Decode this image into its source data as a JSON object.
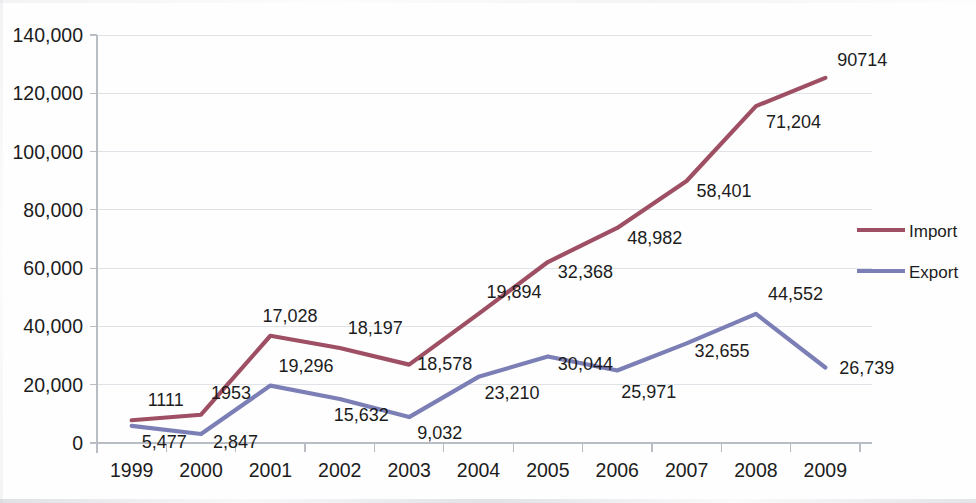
{
  "chart_data": {
    "type": "line",
    "title": "",
    "xlabel": "",
    "ylabel": "",
    "categories": [
      "1999",
      "2000",
      "2001",
      "2002",
      "2003",
      "2004",
      "2005",
      "2006",
      "2007",
      "2008",
      "2009"
    ],
    "ylim": [
      0,
      140000
    ],
    "ytick_values": [
      0,
      20000,
      40000,
      60000,
      80000,
      100000,
      120000,
      140000
    ],
    "ytick_labels": [
      "0",
      "20,000",
      "40,000",
      "60,000",
      "80,000",
      "100,000",
      "120,000",
      "140,000"
    ],
    "grid": true,
    "legend_position": "right",
    "series": [
      {
        "name": "Import",
        "color": "#9e4f63",
        "values": [
          7800,
          9700,
          36800,
          32600,
          26900,
          44300,
          62100,
          73800,
          89900,
          115600,
          125300
        ],
        "data_labels": [
          "1111",
          "1953",
          "17,028",
          "18,197",
          "18,578",
          "19,894",
          "32,368",
          "48,982",
          "58,401",
          "71,204",
          "90714"
        ]
      },
      {
        "name": "Export",
        "color": "#7b7fb5",
        "values": [
          5900,
          3100,
          19700,
          15100,
          8900,
          22700,
          29700,
          24900,
          34200,
          44300,
          25900
        ],
        "data_labels": [
          "5,477",
          "2,847",
          "19,296",
          "15,632",
          "9,032",
          "23,210",
          "30,044",
          "25,971",
          "32,655",
          "44,552",
          "26,739"
        ]
      }
    ]
  },
  "legend": {
    "entries": [
      {
        "label": "Import",
        "color": "#9e4f63"
      },
      {
        "label": "Export",
        "color": "#7b7fb5"
      }
    ]
  },
  "label_offsets": {
    "import": [
      {
        "dx": 16,
        "dy": -14
      },
      {
        "dx": 10,
        "dy": -16
      },
      {
        "dx": -8,
        "dy": -14
      },
      {
        "dx": 8,
        "dy": -14
      },
      {
        "dx": 8,
        "dy": 5
      },
      {
        "dx": 8,
        "dy": -16
      },
      {
        "dx": 10,
        "dy": 16
      },
      {
        "dx": 10,
        "dy": 16
      },
      {
        "dx": 10,
        "dy": 16
      },
      {
        "dx": 10,
        "dy": 22
      },
      {
        "dx": 12,
        "dy": -12
      }
    ],
    "export": [
      {
        "dx": 10,
        "dy": 22
      },
      {
        "dx": 12,
        "dy": 14
      },
      {
        "dx": 8,
        "dy": -14
      },
      {
        "dx": -6,
        "dy": 22
      },
      {
        "dx": 8,
        "dy": 22
      },
      {
        "dx": 6,
        "dy": 22
      },
      {
        "dx": 10,
        "dy": 14
      },
      {
        "dx": 4,
        "dy": 28
      },
      {
        "dx": 8,
        "dy": 14
      },
      {
        "dx": 12,
        "dy": -14
      },
      {
        "dx": 14,
        "dy": 6
      }
    ]
  }
}
